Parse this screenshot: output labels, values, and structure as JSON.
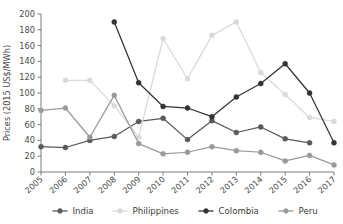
{
  "chart_data": {
    "type": "line",
    "title": "",
    "xlabel": "",
    "ylabel": "Prices (2015 US$/MWh)",
    "x": [
      "2005",
      "2006",
      "2007",
      "2008",
      "2009",
      "2010",
      "2011",
      "2012",
      "2013",
      "2014",
      "2015",
      "2016",
      "2017"
    ],
    "categories": [
      "2005",
      "2006",
      "2007",
      "2008",
      "2009",
      "2010",
      "2011",
      "2012",
      "2013",
      "2014",
      "2015",
      "2016",
      "2017"
    ],
    "ylim": [
      0,
      200
    ],
    "yticks": [
      0,
      20,
      40,
      60,
      80,
      100,
      120,
      140,
      160,
      180,
      200
    ],
    "ytick_labels": [
      "0",
      "20",
      "40",
      "60",
      "80",
      "100",
      "120",
      "140",
      "160",
      "180",
      "200"
    ],
    "grid": false,
    "legend_position": "bottom",
    "series": [
      {
        "name": "India",
        "color": "#5a5a5a",
        "values": [
          32,
          31,
          40,
          45,
          64,
          68,
          41,
          65,
          50,
          57,
          42,
          37,
          null
        ]
      },
      {
        "name": "Philippines",
        "color": "#d9d9d9",
        "values": [
          null,
          116,
          116,
          84,
          44,
          169,
          118,
          173,
          190,
          126,
          98,
          69,
          64
        ]
      },
      {
        "name": "Colombia",
        "color": "#333333",
        "values": [
          null,
          null,
          null,
          190,
          113,
          83,
          81,
          70,
          95,
          112,
          137,
          100,
          37
        ]
      },
      {
        "name": "Peru",
        "color": "#9a9a9a",
        "values": [
          78,
          81,
          44,
          97,
          36,
          23,
          25,
          32,
          27,
          25,
          14,
          21,
          9
        ]
      }
    ]
  },
  "legend": {
    "items": [
      {
        "label": "India"
      },
      {
        "label": "Philippines"
      },
      {
        "label": "Colombia"
      },
      {
        "label": "Peru"
      }
    ]
  },
  "axes": {
    "y_axis_title": "Prices (2015 US$/MWh)"
  }
}
